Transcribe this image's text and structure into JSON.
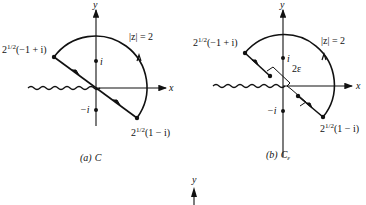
{
  "figure": {
    "panels": [
      {
        "id": "a",
        "caption_letter": "(a)",
        "caption_symbol": "C",
        "axis_x_label": "x",
        "axis_y_label": "y",
        "circle_label": "|z| = 2",
        "point_upper_left_label": "2",
        "point_upper_left_exp": "1/2",
        "point_upper_left_rest": "(−1 + i)",
        "point_lower_right_label": "2",
        "point_lower_right_exp": "1/2",
        "point_lower_right_rest": "(1 − i)",
        "point_i_label": "i",
        "point_neg_i_label": "−i"
      },
      {
        "id": "b",
        "caption_letter": "(b)",
        "caption_symbol": "C",
        "caption_subscript": "ε",
        "axis_x_label": "x",
        "axis_y_label": "y",
        "circle_label": "|z| = 2",
        "gap_label": "2ε",
        "point_upper_left_label": "2",
        "point_upper_left_exp": "1/2",
        "point_upper_left_rest": "(−1 + i)",
        "point_lower_right_label": "2",
        "point_lower_right_exp": "1/2",
        "point_lower_right_rest": "(1 − i)",
        "point_i_label": "i",
        "point_neg_i_label": "−i"
      },
      {
        "id": "c-partial",
        "axis_y_label": "y"
      }
    ]
  }
}
